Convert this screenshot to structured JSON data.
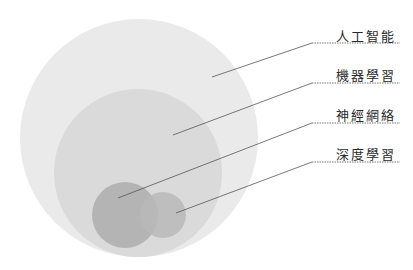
{
  "diagram": {
    "type": "nested-venn",
    "background": "#ffffff",
    "circles": [
      {
        "id": "ai",
        "label": "人工智能",
        "cx": 139,
        "cy": 138,
        "r": 119,
        "color": "#eaeaea"
      },
      {
        "id": "ml",
        "label": "機器學習",
        "cx": 138,
        "cy": 173,
        "r": 84,
        "color": "#dadada"
      },
      {
        "id": "nn",
        "label": "神經網絡",
        "cx": 125,
        "cy": 215,
        "r": 33,
        "color": "#b4b4b4"
      },
      {
        "id": "dl",
        "label": "深度學習",
        "cx": 163,
        "cy": 215,
        "r": 23,
        "color": "#b8b8b8"
      }
    ],
    "labels": [
      {
        "text": "人工智能",
        "x": 336,
        "y": 26,
        "line": {
          "from": [
            212,
            77
          ],
          "elbow": [
            312,
            43
          ],
          "to": [
            400,
            43
          ]
        }
      },
      {
        "text": "機器學習",
        "x": 336,
        "y": 65,
        "line": {
          "from": [
            173,
            135
          ],
          "elbow": [
            312,
            83
          ],
          "to": [
            400,
            83
          ]
        }
      },
      {
        "text": "神經網絡",
        "x": 336,
        "y": 105,
        "line": {
          "from": [
            118,
            198
          ],
          "elbow": [
            312,
            123
          ],
          "to": [
            400,
            123
          ]
        }
      },
      {
        "text": "深度學習",
        "x": 336,
        "y": 144,
        "line": {
          "from": [
            176,
            213
          ],
          "elbow": [
            312,
            162
          ],
          "to": [
            400,
            162
          ]
        }
      }
    ],
    "line_color": "#555555"
  }
}
